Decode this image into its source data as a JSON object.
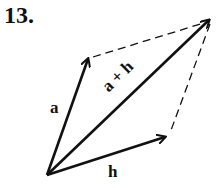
{
  "problem_number": "13.",
  "labels": {
    "a": "a",
    "h": "h",
    "sum": "a + h"
  },
  "colors": {
    "stroke": "#111111",
    "background": "#ffffff"
  }
}
